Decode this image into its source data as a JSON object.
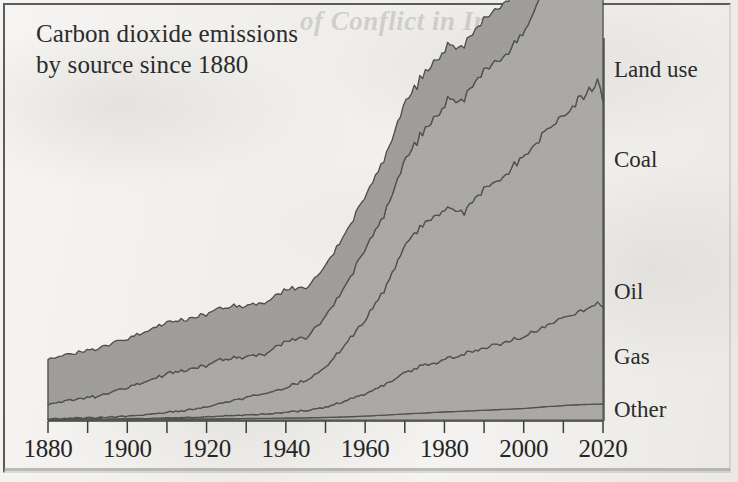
{
  "figure": {
    "title_line_1": "Carbon dioxide emissions",
    "title_line_2": "by source since 1880",
    "bleed_through_text": "of Conflict in Iraq"
  },
  "colors": {
    "paper": "#f2f1ef",
    "ink": "#262626",
    "frame": "#5b5b5b",
    "band_fill": "#a9a7a4",
    "band_fill_top": "#9d9b98",
    "band_outline": "#4a4a4a",
    "axis": "#3d3d3d"
  },
  "axis": {
    "x_tick_labels": [
      "1880",
      "1900",
      "1920",
      "1940",
      "1960",
      "1980",
      "2000",
      "2020"
    ],
    "x_minor_tick_years": [
      1880,
      1890,
      1900,
      1910,
      1920,
      1930,
      1940,
      1950,
      1960,
      1970,
      1980,
      1990,
      2000,
      2010,
      2020
    ],
    "x_min": 1880,
    "x_max": 2020,
    "y_visible_ticks": false
  },
  "legend": {
    "items": [
      {
        "label": "Land use",
        "y_px": 58
      },
      {
        "label": "Coal",
        "y_px": 148
      },
      {
        "label": "Oil",
        "y_px": 280
      },
      {
        "label": "Gas",
        "y_px": 345
      },
      {
        "label": "Other",
        "y_px": 398
      }
    ]
  },
  "chart_data": {
    "type": "area",
    "title": "Carbon dioxide emissions by source since 1880",
    "subtitle": "",
    "xlabel": "",
    "ylabel": "",
    "stacked": true,
    "grid": false,
    "legend_position": "right-of-plot-inline",
    "xlim": [
      1880,
      2020
    ],
    "ylim": [
      0,
      40
    ],
    "y_units": "billion tonnes CO2 per year (approx.)",
    "x": [
      1880,
      1885,
      1890,
      1895,
      1900,
      1905,
      1910,
      1915,
      1920,
      1925,
      1930,
      1935,
      1940,
      1945,
      1950,
      1955,
      1960,
      1965,
      1970,
      1975,
      1980,
      1985,
      1990,
      1995,
      2000,
      2005,
      2010,
      2015,
      2018,
      2019,
      2020
    ],
    "series": [
      {
        "name": "Other",
        "order": 1,
        "values": [
          0.05,
          0.05,
          0.06,
          0.06,
          0.07,
          0.08,
          0.09,
          0.1,
          0.11,
          0.13,
          0.15,
          0.17,
          0.2,
          0.22,
          0.26,
          0.32,
          0.4,
          0.5,
          0.62,
          0.72,
          0.82,
          0.9,
          1.0,
          1.08,
          1.18,
          1.34,
          1.48,
          1.58,
          1.62,
          1.63,
          1.6
        ]
      },
      {
        "name": "Gas",
        "order": 2,
        "values": [
          0.02,
          0.03,
          0.04,
          0.05,
          0.07,
          0.09,
          0.12,
          0.16,
          0.22,
          0.3,
          0.38,
          0.45,
          0.58,
          0.75,
          1.05,
          1.6,
          2.3,
          3.1,
          4.2,
          4.9,
          5.4,
          5.9,
          6.4,
          6.8,
          7.4,
          8.2,
          9.0,
          9.6,
          10.1,
          10.3,
          10.0
        ]
      },
      {
        "name": "Oil",
        "order": 3,
        "values": [
          0.05,
          0.08,
          0.12,
          0.18,
          0.26,
          0.38,
          0.55,
          0.75,
          1.0,
          1.4,
          1.8,
          2.1,
          2.6,
          3.0,
          4.1,
          5.8,
          7.6,
          9.8,
          13.0,
          14.4,
          15.2,
          14.6,
          16.2,
          17.0,
          18.4,
          19.8,
          20.8,
          21.8,
          22.4,
          22.6,
          20.8
        ]
      },
      {
        "name": "Coal",
        "order": 4,
        "values": [
          1.5,
          1.8,
          2.1,
          2.4,
          2.9,
          3.4,
          4.0,
          4.1,
          4.3,
          4.4,
          4.1,
          4.1,
          4.8,
          4.3,
          5.2,
          6.1,
          7.2,
          7.8,
          8.6,
          9.6,
          10.8,
          11.6,
          12.2,
          12.1,
          12.4,
          15.2,
          17.8,
          19.0,
          19.6,
          19.4,
          18.8
        ]
      },
      {
        "name": "Land use",
        "order": 5,
        "values": [
          4.6,
          4.7,
          4.8,
          4.9,
          5.0,
          5.1,
          5.2,
          5.1,
          5.2,
          5.3,
          5.2,
          5.2,
          5.3,
          5.1,
          5.2,
          5.3,
          5.4,
          5.6,
          5.8,
          5.8,
          5.6,
          5.4,
          5.2,
          5.4,
          5.2,
          5.1,
          5.0,
          4.9,
          4.8,
          4.8,
          4.7
        ]
      }
    ]
  }
}
